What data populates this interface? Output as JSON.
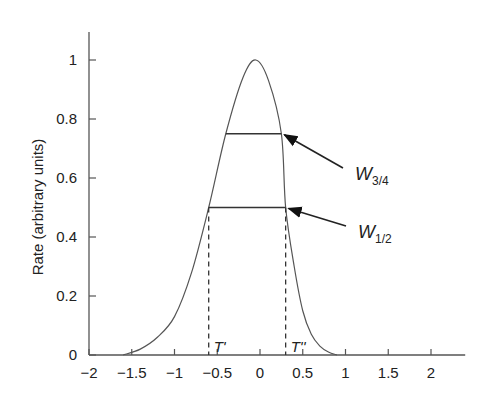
{
  "chart_data": {
    "type": "line",
    "title": "",
    "xlabel": "",
    "ylabel": "Rate (arbitrary units)",
    "xlim": [
      -2,
      2.4
    ],
    "ylim": [
      0,
      1.08
    ],
    "grid": false,
    "legend": null,
    "x_ticks": [
      -2,
      -1.5,
      -1,
      -0.5,
      0,
      0.5,
      1,
      1.5,
      2
    ],
    "x_tick_labels": [
      "−2",
      "−1.5",
      "−1",
      "−0.5",
      "0",
      "0.5",
      "1",
      "1.5",
      "2"
    ],
    "y_ticks": [
      0,
      0.2,
      0.4,
      0.6,
      0.8,
      1
    ],
    "y_tick_labels": [
      "0",
      "0.2",
      "0.4",
      "0.6",
      "0.8",
      "1"
    ],
    "series": [
      {
        "name": "rate curve",
        "x": [
          -1.6,
          -1.4,
          -1.2,
          -1.0,
          -0.8,
          -0.6,
          -0.4,
          -0.2,
          -0.05,
          0.1,
          0.25,
          0.3,
          0.4,
          0.5,
          0.6,
          0.7,
          0.8,
          0.9
        ],
        "y": [
          0.0,
          0.02,
          0.06,
          0.13,
          0.28,
          0.5,
          0.75,
          0.94,
          1.0,
          0.93,
          0.75,
          0.5,
          0.3,
          0.15,
          0.07,
          0.03,
          0.01,
          0.0
        ]
      }
    ],
    "annotations": [
      {
        "label": "W",
        "sub": "3/4",
        "type": "width-bar",
        "y": 0.75,
        "x_from": -0.4,
        "x_to": 0.25
      },
      {
        "label": "W",
        "sub": "1/2",
        "type": "width-bar",
        "y": 0.5,
        "x_from": -0.6,
        "x_to": 0.3
      },
      {
        "label": "T'",
        "type": "dashed-vline",
        "x": -0.6
      },
      {
        "label": "T''",
        "type": "dashed-vline",
        "x": 0.3
      }
    ],
    "line_color": "#555555",
    "text_color": "#222222"
  }
}
